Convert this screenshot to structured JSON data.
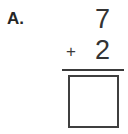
{
  "problem": {
    "label": "A.",
    "type": "vertical-addition",
    "operator": "+",
    "addend_top": "7",
    "addend_bottom": "2",
    "answer": "",
    "answer_placeholder": ""
  },
  "colors": {
    "background": "#ffffff",
    "label_text": "#262626",
    "digit_text": "#333333",
    "operator_text": "#3a3a3a",
    "rule": "#3a3a3a",
    "answer_box_border": "#3f3f3f"
  }
}
